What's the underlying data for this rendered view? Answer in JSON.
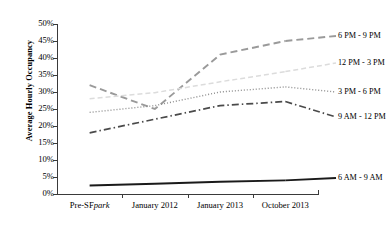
{
  "chart_data": {
    "type": "line",
    "title": "",
    "xlabel": "",
    "ylabel": "Average Hourly Occupancy",
    "ylim": [
      0,
      50
    ],
    "ytick_labels": [
      "0%",
      "5%",
      "10%",
      "15%",
      "20%",
      "25%",
      "30%",
      "35%",
      "40%",
      "45%",
      "50%"
    ],
    "ytick_values": [
      0,
      5,
      10,
      15,
      20,
      25,
      30,
      35,
      40,
      45,
      50
    ],
    "grid": false,
    "legend_position": "right-inline",
    "categories": [
      "Pre-SFpark",
      "January 2012",
      "January 2013",
      "October 2013"
    ],
    "category_labels_html": [
      "Pre-SF<i>park</i>",
      "January 2012",
      "January 2013",
      "October 2013"
    ],
    "series": [
      {
        "name": "6 PM - 9 PM",
        "values": [
          32.0,
          25.0,
          41.0,
          45.0
        ],
        "style": "long-dash",
        "color": "#9a9a9a",
        "width": 1.9,
        "dasharray": "7,4",
        "label_y": 36
      },
      {
        "name": "12 PM - 3 PM",
        "values": [
          28.0,
          29.8,
          33.0,
          36.0
        ],
        "style": "light-dash",
        "color": "#dcdcdc",
        "width": 1.5,
        "dasharray": "5,3",
        "label_y": 63
      },
      {
        "name": "3 PM - 6 PM",
        "values": [
          24.0,
          26.0,
          30.0,
          31.5
        ],
        "style": "dotted",
        "color": "#8c8c8c",
        "width": 1.4,
        "dasharray": "1,2",
        "label_y": 92
      },
      {
        "name": "9 AM - 12 PM",
        "values": [
          18.0,
          22.0,
          26.0,
          27.2
        ],
        "style": "dash-dot",
        "color": "#4a4a4a",
        "width": 1.7,
        "dasharray": "7,3,1.5,3",
        "label_y": 117
      },
      {
        "name": "6 AM - 9 AM",
        "values": [
          2.5,
          3.0,
          3.6,
          4.0
        ],
        "style": "solid",
        "color": "#1a1a1a",
        "width": 1.9,
        "dasharray": "none",
        "label_y": 178
      }
    ]
  },
  "axis": {
    "y_title": "Average Hourly Occupancy"
  }
}
